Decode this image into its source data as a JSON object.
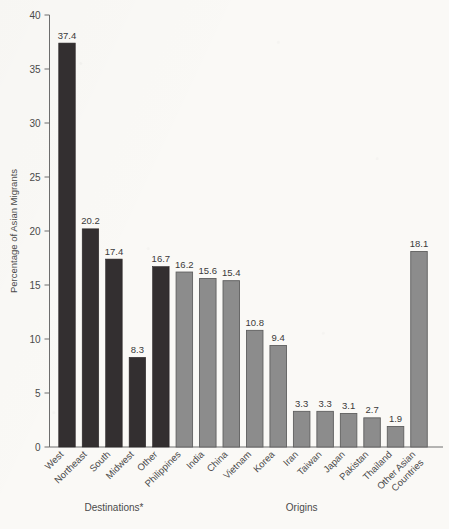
{
  "chart_data": {
    "type": "bar",
    "title": "",
    "subtitle": "",
    "xlabel": "",
    "ylabel": "Percentage of Asian Migrants",
    "ylim": [
      0,
      40
    ],
    "ytick_values": [
      0,
      5,
      10,
      15,
      20,
      25,
      30,
      35,
      40
    ],
    "ytick_labels": [
      "0",
      "5",
      "10",
      "15",
      "20",
      "25",
      "30",
      "35",
      "40"
    ],
    "grid": false,
    "legend": null,
    "categories": [
      "West",
      "Northeast",
      "South",
      "Midwest",
      "Other",
      "Philippines",
      "India",
      "China",
      "Vietnam",
      "Korea",
      "Iran",
      "Taiwan",
      "Japan",
      "Pakistan",
      "Thailand",
      "Other Asian Countries"
    ],
    "values": [
      37.4,
      20.2,
      17.4,
      8.3,
      16.7,
      16.2,
      15.6,
      15.4,
      10.8,
      9.4,
      3.3,
      3.3,
      3.1,
      2.7,
      1.9,
      18.1
    ],
    "value_labels": [
      "37.4",
      "20.2",
      "17.4",
      "8.3",
      "16.7",
      "16.2",
      "15.6",
      "15.4",
      "10.8",
      "9.4",
      "3.3",
      "3.3",
      "3.1",
      "2.7",
      "1.9",
      "18.1"
    ],
    "bar_colors": [
      "#332f30",
      "#332f30",
      "#332f30",
      "#332f30",
      "#332f30",
      "#8c8c8c",
      "#8c8c8c",
      "#8c8c8c",
      "#8c8c8c",
      "#8c8c8c",
      "#8c8c8c",
      "#8c8c8c",
      "#8c8c8c",
      "#8c8c8c",
      "#8c8c8c",
      "#8c8c8c"
    ],
    "groups": [
      {
        "label": "Destinations*",
        "start_index": 0,
        "end_index": 4
      },
      {
        "label": "Origins",
        "start_index": 5,
        "end_index": 15
      }
    ],
    "category_label_lines": [
      [
        "West"
      ],
      [
        "Northeast"
      ],
      [
        "South"
      ],
      [
        "Midwest"
      ],
      [
        "Other"
      ],
      [
        "Philippines"
      ],
      [
        "India"
      ],
      [
        "China"
      ],
      [
        "Vietnam"
      ],
      [
        "Korea"
      ],
      [
        "Iran"
      ],
      [
        "Taiwan"
      ],
      [
        "Japan"
      ],
      [
        "Pakistan"
      ],
      [
        "Thailand"
      ],
      [
        "Other Asian",
        "Countries"
      ]
    ]
  },
  "style": {
    "background_color": "#faf9f6",
    "dark_bar_color": "#332f30",
    "light_bar_color": "#8c8c8c",
    "axis_color": "#6e6e6e",
    "text_color": "#4a4a4a"
  },
  "axis_titles": {
    "y": "Percentage of Asian Migrants"
  },
  "group_labels": {
    "destinations": "Destinations*",
    "origins": "Origins"
  }
}
